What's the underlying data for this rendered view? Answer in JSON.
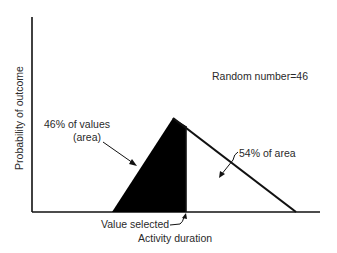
{
  "diagram": {
    "y_axis_label": "Probability of outcome",
    "x_axis_label": "Activity duration",
    "random_number_label": "Random number=46",
    "left_area_label_line1": "46% of values",
    "left_area_label_line2": "(area)",
    "right_area_label": "54% of area",
    "value_selected_label": "Value selected",
    "colors": {
      "ink": "#111111",
      "shaded_area": "#000000",
      "background": "#ffffff",
      "text": "#2a2a2a"
    },
    "shape": {
      "type": "triangle",
      "left_vertex": [
        112,
        212
      ],
      "peak": [
        173,
        118
      ],
      "right_vertex": [
        296,
        212
      ],
      "selected_x": 186
    },
    "percentages": {
      "left_area_pct": 46,
      "right_area_pct": 54,
      "random_number": 46
    }
  }
}
